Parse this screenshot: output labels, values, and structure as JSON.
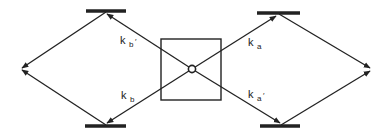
{
  "diagram": {
    "type": "kinetic-scheme",
    "colors": {
      "line": "#222222",
      "background": "#ffffff"
    },
    "labels": {
      "kb_prime": {
        "main": "k",
        "sub": "b",
        "prime": "′"
      },
      "kb": {
        "main": "k",
        "sub": "b",
        "prime": ""
      },
      "ka": {
        "main": "k",
        "sub": "a",
        "prime": ""
      },
      "ka_prime": {
        "main": "k",
        "sub": "a",
        "prime": "′"
      }
    },
    "nodes": [
      {
        "id": "center",
        "shape": "square-with-circle"
      },
      {
        "id": "top-left-state",
        "shape": "bar"
      },
      {
        "id": "bottom-left-state",
        "shape": "bar"
      },
      {
        "id": "top-right-state",
        "shape": "bar"
      },
      {
        "id": "bottom-right-state",
        "shape": "bar"
      },
      {
        "id": "left-apex",
        "shape": "point"
      },
      {
        "id": "right-apex",
        "shape": "point"
      }
    ],
    "edges": [
      {
        "from": "center",
        "to": "top-left-state",
        "label": "kb_prime"
      },
      {
        "from": "center",
        "to": "bottom-left-state",
        "label": "kb"
      },
      {
        "from": "center",
        "to": "top-right-state",
        "label": "ka"
      },
      {
        "from": "center",
        "to": "bottom-right-state",
        "label": "ka_prime"
      },
      {
        "from": "top-left-state",
        "to": "left-apex",
        "label": ""
      },
      {
        "from": "bottom-left-state",
        "to": "left-apex",
        "label": ""
      },
      {
        "from": "top-right-state",
        "to": "right-apex",
        "label": ""
      },
      {
        "from": "bottom-right-state",
        "to": "right-apex",
        "label": ""
      }
    ]
  }
}
